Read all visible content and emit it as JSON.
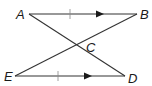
{
  "diagram": {
    "type": "geometry",
    "points": {
      "A": {
        "label": "A",
        "x": 29,
        "y": 14
      },
      "B": {
        "label": "B",
        "x": 137,
        "y": 14
      },
      "C": {
        "label": "C",
        "x": 77,
        "y": 44
      },
      "D": {
        "label": "D",
        "x": 125,
        "y": 76
      },
      "E": {
        "label": "E",
        "x": 15,
        "y": 76
      }
    },
    "segments": [
      {
        "from": "A",
        "to": "B",
        "marks": [
          "congruence-tick",
          "parallel-arrow"
        ]
      },
      {
        "from": "E",
        "to": "D",
        "marks": [
          "congruence-tick",
          "parallel-arrow"
        ]
      },
      {
        "from": "A",
        "to": "D",
        "marks": []
      },
      {
        "from": "E",
        "to": "B",
        "marks": []
      }
    ],
    "labels": {
      "A": "A",
      "B": "B",
      "C": "C",
      "D": "D",
      "E": "E"
    }
  }
}
